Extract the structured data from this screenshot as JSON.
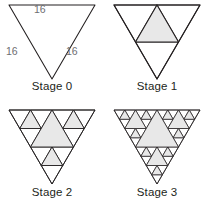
{
  "figure": {
    "background_color": "#ffffff",
    "stroke_color": "#231f20",
    "fill_color": "#e8e8e8",
    "label_color": "#6d6e71",
    "orientation": "inverted",
    "columns": 2,
    "rows": 2
  },
  "stages": [
    {
      "id": "stage-0",
      "caption": "Stage 0",
      "depth": 0,
      "shaded_count": 0,
      "side_labels": {
        "top": "16",
        "left": "16",
        "right": "16"
      }
    },
    {
      "id": "stage-1",
      "caption": "Stage 1",
      "depth": 1,
      "shaded_count": 1,
      "side_labels": null
    },
    {
      "id": "stage-2",
      "caption": "Stage 2",
      "depth": 2,
      "shaded_count": 4,
      "side_labels": null
    },
    {
      "id": "stage-3",
      "caption": "Stage 3",
      "depth": 3,
      "shaded_count": 13,
      "side_labels": null
    }
  ]
}
